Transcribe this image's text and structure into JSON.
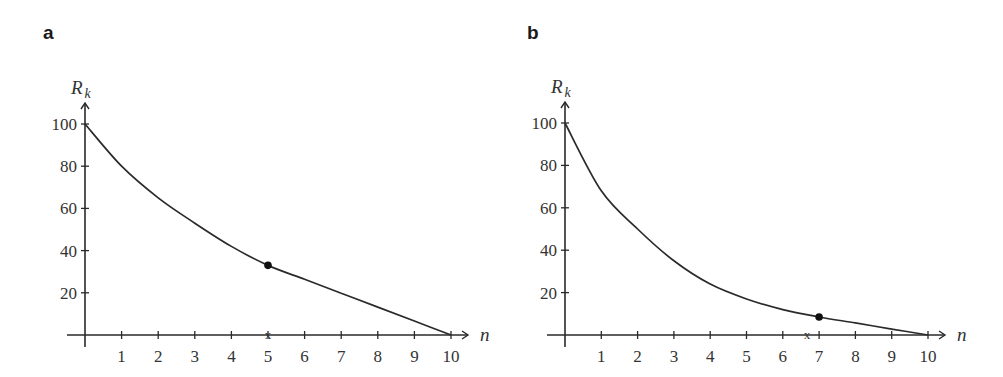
{
  "chart_data": [
    {
      "panel": "a",
      "type": "line",
      "title": "",
      "xlabel": "n",
      "ylabel": "R_k",
      "ylabel_main": "R",
      "ylabel_sub": "k",
      "xlim": [
        0,
        10
      ],
      "ylim": [
        0,
        100
      ],
      "x_ticks": [
        1,
        2,
        3,
        4,
        5,
        6,
        7,
        8,
        9,
        10
      ],
      "y_ticks": [
        20,
        40,
        60,
        80,
        100
      ],
      "grid": false,
      "series": [
        {
          "name": "R_k",
          "x": [
            0,
            1,
            2,
            3,
            4,
            5,
            6,
            7,
            8,
            9,
            10
          ],
          "values": [
            100,
            80,
            65,
            53,
            42,
            33,
            26.4,
            19.8,
            13.2,
            6.6,
            0
          ]
        }
      ],
      "highlight_point": {
        "x": 5,
        "y": 33
      },
      "axis_marker": {
        "x": 5,
        "label": "x"
      }
    },
    {
      "panel": "b",
      "type": "line",
      "title": "",
      "xlabel": "n",
      "ylabel": "R_k",
      "ylabel_main": "R",
      "ylabel_sub": "k",
      "xlim": [
        0,
        10
      ],
      "ylim": [
        0,
        100
      ],
      "x_ticks": [
        1,
        2,
        3,
        4,
        5,
        6,
        7,
        8,
        9,
        10
      ],
      "y_ticks": [
        20,
        40,
        60,
        80,
        100
      ],
      "grid": false,
      "series": [
        {
          "name": "R_k",
          "x": [
            0,
            1,
            2,
            3,
            4,
            5,
            6,
            7,
            8,
            9,
            10
          ],
          "values": [
            100,
            68,
            50,
            35,
            24,
            17,
            12,
            8.5,
            5.7,
            2.8,
            0
          ]
        }
      ],
      "highlight_point": {
        "x": 7,
        "y": 8.5
      },
      "axis_marker": {
        "x": 6.67,
        "label": "x"
      }
    }
  ],
  "layout": [
    {
      "panel_label": "a",
      "origin_x": 85,
      "origin_y": 335,
      "x_unit": 36.6,
      "y_unit": 2.11,
      "label_x": 43,
      "label_y": 22
    },
    {
      "panel_label": "b",
      "origin_x": 565,
      "origin_y": 335,
      "x_unit": 36.3,
      "y_unit": 2.12,
      "label_x": 527,
      "label_y": 22
    }
  ],
  "colors": {
    "line": "#2a2a2a",
    "axis": "#2a2a2a",
    "text": "#333333"
  }
}
